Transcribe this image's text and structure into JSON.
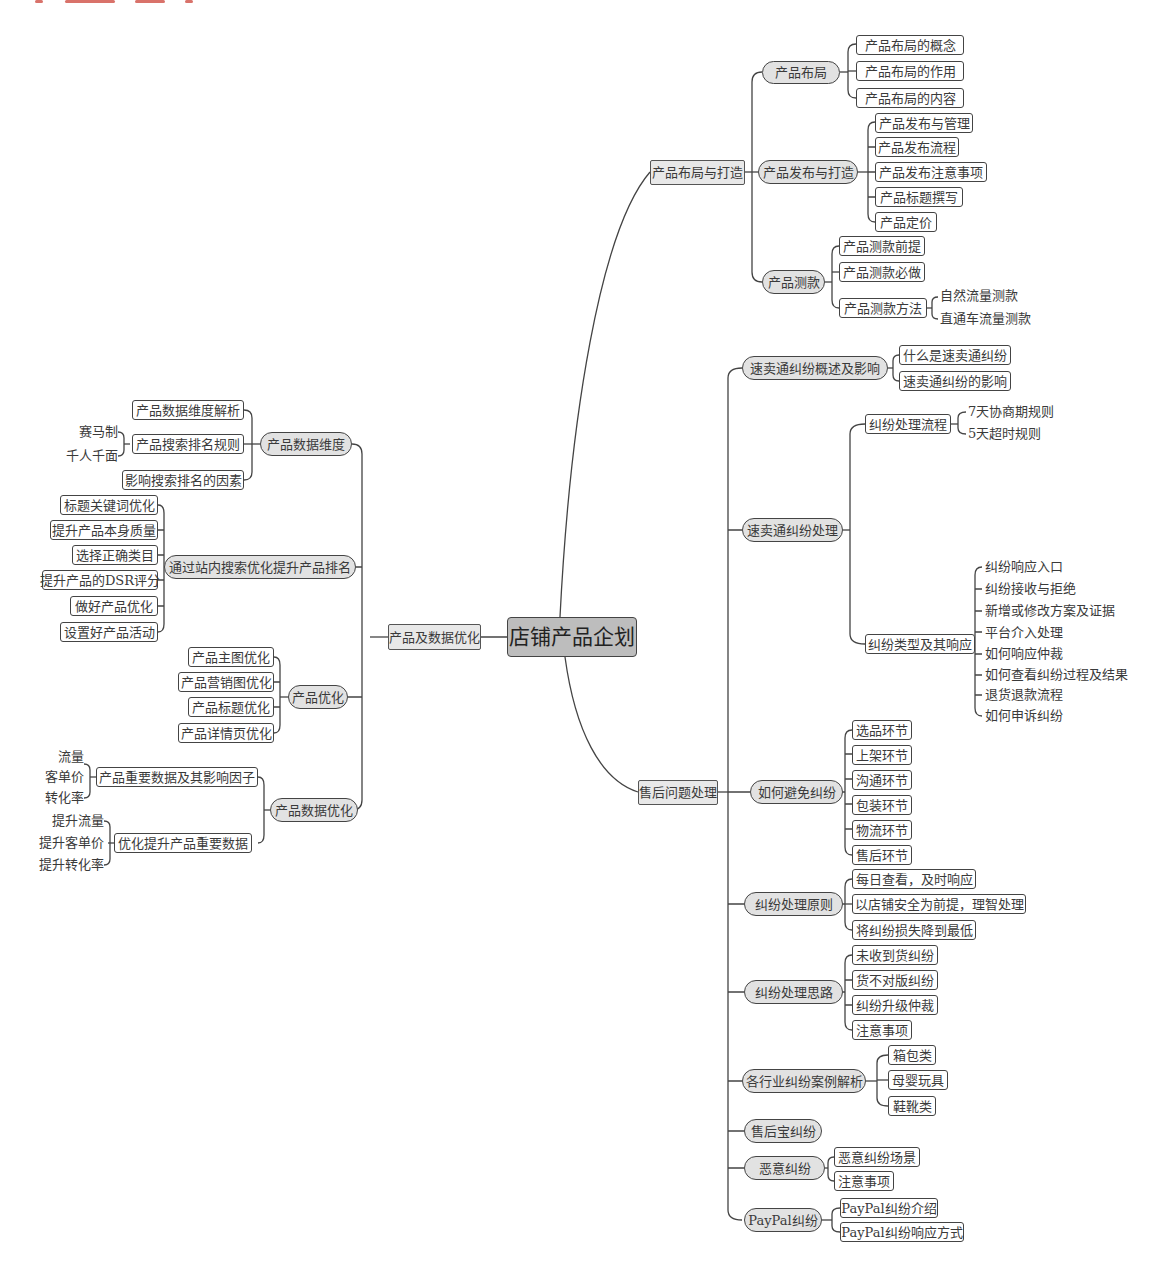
{
  "root": {
    "label": "店铺产品企划"
  },
  "branches": {
    "layout": {
      "label": "产品布局与打造"
    },
    "aftersale": {
      "label": "售后问题处理"
    },
    "data": {
      "label": "产品及数据优化"
    }
  },
  "layout_children": {
    "buju": {
      "label": "产品布局",
      "leaves": [
        "产品布局的概念",
        "产品布局的作用",
        "产品布局的内容"
      ]
    },
    "fabu": {
      "label": "产品发布与打造",
      "leaves": [
        "产品发布与管理",
        "产品发布流程",
        "产品发布注意事项",
        "产品标题撰写",
        "产品定价"
      ]
    },
    "cekuan": {
      "label": "产品测款",
      "leaves": [
        "产品测款前提",
        "产品测款必做",
        "产品测款方法"
      ],
      "method_items": [
        "自然流量测款",
        "直通车流量测款"
      ]
    }
  },
  "aftersale_children": {
    "overview": {
      "label": "速卖通纠纷概述及影响",
      "leaves": [
        "什么是速卖通纠纷",
        "速卖通纠纷的影响"
      ]
    },
    "handling": {
      "label": "速卖通纠纷处理",
      "process": {
        "label": "纠纷处理流程",
        "items": [
          "7天协商期规则",
          "5天超时规则"
        ]
      },
      "types": {
        "label": "纠纷类型及其响应",
        "items": [
          "纠纷响应入口",
          "纠纷接收与拒绝",
          "新增或修改方案及证据",
          "平台介入处理",
          "如何响应仲裁",
          "如何查看纠纷过程及结果",
          "退货退款流程",
          "如何申诉纠纷"
        ]
      }
    },
    "avoid": {
      "label": "如何避免纠纷",
      "leaves": [
        "选品环节",
        "上架环节",
        "沟通环节",
        "包装环节",
        "物流环节",
        "售后环节"
      ]
    },
    "principle": {
      "label": "纠纷处理原则",
      "leaves": [
        "每日查看，及时响应",
        "以店铺安全为前提，理智处理",
        "将纠纷损失降到最低"
      ]
    },
    "approach": {
      "label": "纠纷处理思路",
      "leaves": [
        "未收到货纠纷",
        "货不对版纠纷",
        "纠纷升级仲裁",
        "注意事项"
      ]
    },
    "cases": {
      "label": "各行业纠纷案例解析",
      "leaves": [
        "箱包类",
        "母婴玩具",
        "鞋靴类"
      ]
    },
    "shouhoubao": {
      "label": "售后宝纠纷"
    },
    "malicious": {
      "label": "恶意纠纷",
      "leaves": [
        "恶意纠纷场景",
        "注意事项"
      ]
    },
    "paypal": {
      "label": "PayPal纠纷",
      "leaves": [
        "PayPal纠纷介绍",
        "PayPal纠纷响应方式"
      ]
    }
  },
  "data_children": {
    "dimension": {
      "label": "产品数据维度",
      "leaves": [
        "产品数据维度解析",
        "产品搜索排名规则",
        "影响搜索排名的因素"
      ],
      "rank_items": [
        "赛马制",
        "千人千面"
      ]
    },
    "search": {
      "label": "通过站内搜索优化提升产品排名",
      "leaves": [
        "标题关键词优化",
        "提升产品本身质量",
        "选择正确类目",
        "提升产品的DSR评分",
        "做好产品优化",
        "设置好产品活动"
      ]
    },
    "optimize": {
      "label": "产品优化",
      "leaves": [
        "产品主图优化",
        "产品营销图优化",
        "产品标题优化",
        "产品详情页优化"
      ]
    },
    "dataopt": {
      "label": "产品数据优化",
      "factors": {
        "label": "产品重要数据及其影响因子",
        "items": [
          "流量",
          "客单价",
          "转化率"
        ]
      },
      "improve": {
        "label": "优化提升产品重要数据",
        "items": [
          "提升流量",
          "提升客单价",
          "提升转化率"
        ]
      }
    }
  }
}
